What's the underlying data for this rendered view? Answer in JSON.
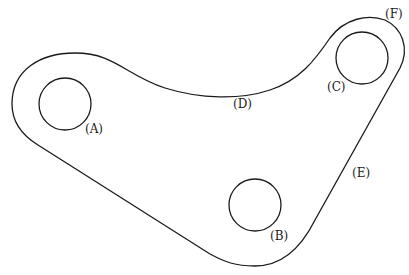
{
  "diagram": {
    "title": "",
    "type": "mechanical-link-plate",
    "colors": {
      "stroke": "#1a1a1a",
      "background": "#ffffff"
    },
    "holes": [
      {
        "id": "A",
        "label": "(A)",
        "cx": 65,
        "cy": 104,
        "r": 26,
        "label_x": 85,
        "label_y": 133
      },
      {
        "id": "B",
        "label": "(B)",
        "cx": 255,
        "cy": 205,
        "r": 26,
        "label_x": 270,
        "label_y": 240
      },
      {
        "id": "C",
        "label": "(C)",
        "cx": 362,
        "cy": 58,
        "r": 26,
        "label_x": 327,
        "label_y": 91
      }
    ],
    "edge_labels": [
      {
        "id": "D",
        "label": "(D)",
        "x": 233,
        "y": 108,
        "describes": "concave upper edge"
      },
      {
        "id": "E",
        "label": "(E)",
        "x": 352,
        "y": 177,
        "describes": "straight right edge"
      },
      {
        "id": "F",
        "label": "(F)",
        "x": 385,
        "y": 18,
        "describes": "outer arc around C"
      }
    ]
  }
}
